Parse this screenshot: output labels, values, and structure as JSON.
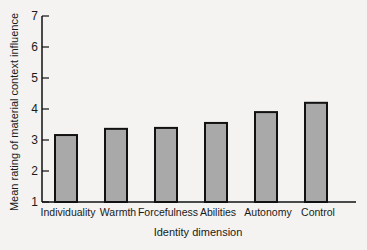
{
  "chart_data": {
    "type": "bar",
    "title": "",
    "xlabel": "Identity dimension",
    "ylabel": "Mean rating of material context influence",
    "categories": [
      "Individuality",
      "Warmth",
      "Forcefulness",
      "Abilities",
      "Autonomy",
      "Control"
    ],
    "values": [
      3.16,
      3.36,
      3.39,
      3.55,
      3.9,
      4.2
    ],
    "ylim": [
      1,
      7
    ],
    "yticks": [
      1,
      2,
      3,
      4,
      5,
      6,
      7
    ],
    "grid": false,
    "legend": null,
    "colors": {
      "bar_fill": "#a9a9a9",
      "bar_stroke": "#111111",
      "axis": "#111111"
    }
  }
}
